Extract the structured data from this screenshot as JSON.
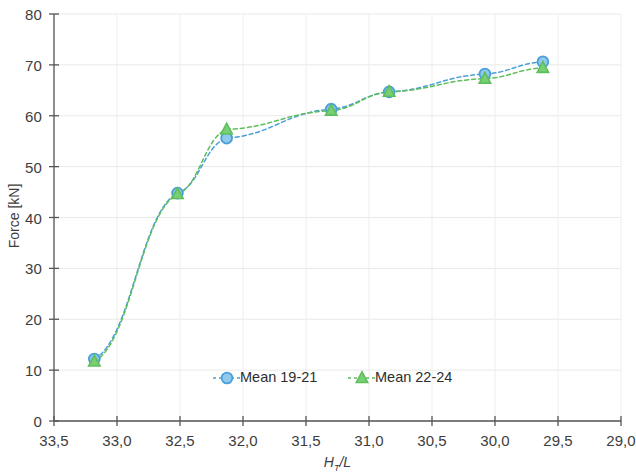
{
  "chart_data": {
    "type": "line",
    "title": "",
    "xlabel": "H_T/L",
    "xlabel_main": "H",
    "xlabel_sub": "T",
    "xlabel_rest": "/L",
    "ylabel": "Force [kN]",
    "xlim": [
      33.5,
      29.0
    ],
    "ylim": [
      0,
      80
    ],
    "x_reversed": true,
    "grid": true,
    "legend_position": "inside-bottom-center",
    "x_ticks": [
      "33,5",
      "33,0",
      "32,5",
      "32,0",
      "31,5",
      "31,0",
      "30,5",
      "30,0",
      "29,5",
      "29,0"
    ],
    "x_tick_values": [
      33.5,
      33.0,
      32.5,
      32.0,
      31.5,
      31.0,
      30.5,
      30.0,
      29.5,
      29.0
    ],
    "y_ticks": [
      "0",
      "10",
      "20",
      "30",
      "40",
      "50",
      "60",
      "70",
      "80"
    ],
    "y_tick_values": [
      0,
      10,
      20,
      30,
      40,
      50,
      60,
      70,
      80
    ],
    "series": [
      {
        "name": "Mean 19-21",
        "color": "#4A9FD8",
        "marker": "circle",
        "linestyle": "dashed",
        "x": [
          33.18,
          32.52,
          32.13,
          31.3,
          30.84,
          30.08,
          29.62
        ],
        "y": [
          12.2,
          44.8,
          55.6,
          61.3,
          64.7,
          68.2,
          70.6
        ]
      },
      {
        "name": "Mean 22-24",
        "color": "#5FBE5C",
        "marker": "triangle",
        "linestyle": "dashed",
        "x": [
          33.18,
          32.52,
          32.13,
          31.3,
          30.84,
          30.08,
          29.62
        ],
        "y": [
          11.7,
          44.6,
          57.3,
          61.0,
          64.7,
          67.3,
          69.4
        ]
      }
    ]
  },
  "legend": {
    "entries": [
      {
        "label": "Mean 19-21",
        "color": "#4A9FD8",
        "marker": "circle"
      },
      {
        "label": "Mean 22-24",
        "color": "#5FBE5C",
        "marker": "triangle"
      }
    ]
  },
  "axes": {
    "y_title": "Force [kN]",
    "x_title_main": "H",
    "x_title_sub": "T",
    "x_title_rest": "/L"
  }
}
